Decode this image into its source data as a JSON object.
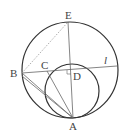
{
  "diagram": {
    "type": "geometry",
    "labels": {
      "E": "E",
      "B": "B",
      "C": "C",
      "D": "D",
      "A": "A",
      "l": "l"
    },
    "points": {
      "E": [
        68,
        21
      ],
      "B": [
        22,
        73
      ],
      "C": [
        47,
        71
      ],
      "D": [
        71,
        70
      ],
      "A": [
        73,
        118
      ],
      "L": [
        117,
        66
      ]
    },
    "big_circle": {
      "cx": 70,
      "cy": 70,
      "r": 48
    },
    "small_circle": {
      "cx": 72,
      "cy": 91,
      "r": 28
    },
    "colors": {
      "stroke": "#333333",
      "dashed": "#999999"
    }
  }
}
